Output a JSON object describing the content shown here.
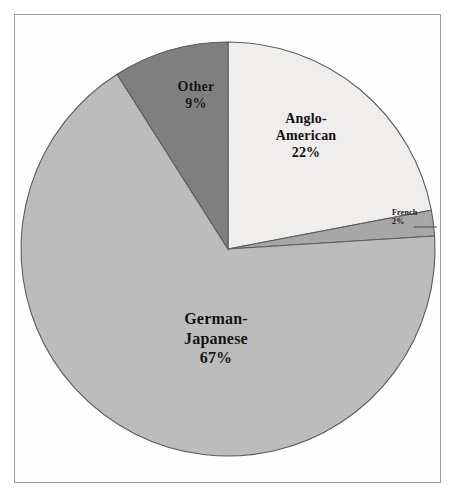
{
  "figure": {
    "background_color": "#ffffff",
    "frame_color": "#9a9a9a"
  },
  "chart_data": {
    "type": "pie",
    "title": "",
    "subtitle": "",
    "xlabel": "",
    "ylabel": "",
    "legend_position": "none",
    "grid": false,
    "units": "percent",
    "start_angle_deg": 0,
    "direction": "clockwise",
    "center": {
      "x": 228,
      "y": 249
    },
    "radius": 207,
    "categories": [
      "Anglo-American",
      "French",
      "German-Japanese",
      "Other"
    ],
    "values": [
      22,
      2,
      67,
      9
    ],
    "colors": [
      "#f0efed",
      "#a8a8a8",
      "#bdbdbd",
      "#808080"
    ],
    "slices": [
      {
        "name": "Anglo-American",
        "label_lines": [
          "Anglo-",
          "American"
        ],
        "percent_text": "22%",
        "value": 22,
        "color": "#f0efed",
        "start_angle_deg": 0,
        "end_angle_deg": 79.2
      },
      {
        "name": "French",
        "label_lines": [
          "French"
        ],
        "percent_text": "2%",
        "value": 2,
        "color": "#a8a8a8",
        "start_angle_deg": 79.2,
        "end_angle_deg": 86.4
      },
      {
        "name": "German-Japanese",
        "label_lines": [
          "German-",
          "Japanese"
        ],
        "percent_text": "67%",
        "value": 67,
        "color": "#bdbdbd",
        "start_angle_deg": 86.4,
        "end_angle_deg": 327.6
      },
      {
        "name": "Other",
        "label_lines": [
          "Other"
        ],
        "percent_text": "9%",
        "value": 9,
        "color": "#808080",
        "start_angle_deg": 327.6,
        "end_angle_deg": 360
      }
    ]
  },
  "labels": {
    "anglo_line1": "Anglo-",
    "anglo_line2": "American",
    "anglo_pct": "22%",
    "french_line1": "French",
    "french_pct": "2%",
    "german_line1": "German-",
    "german_line2": "Japanese",
    "german_pct": "67%",
    "other_line1": "Other",
    "other_pct": "9%"
  }
}
